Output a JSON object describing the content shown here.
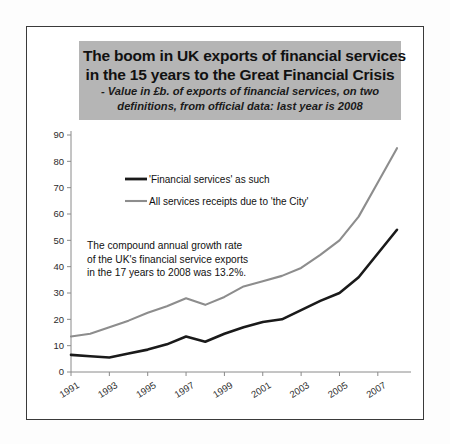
{
  "figure": {
    "title_lines": [
      "The boom in UK exports of financial services",
      "in the 15 years to the Great Financial Crisis"
    ],
    "subtitle_lines": [
      "- Value in £b. of exports of financial services, on two",
      "definitions, from official data: last year is 2008"
    ],
    "title_band_color": "#b5b5b5",
    "frame_color": "#3a3a3a"
  },
  "annotation": {
    "lines": [
      "The compound annual growth rate",
      "of the UK's financial service exports",
      "in the 17 years to 2008 was 13.2%."
    ]
  },
  "chart_data": {
    "type": "line",
    "title": "The boom in UK exports of financial services in the 15 years to the Great Financial Crisis",
    "subtitle": "- Value in £b. of exports of financial services, on two definitions, from official data: last year is 2008",
    "xlabel": "",
    "ylabel": "",
    "x": [
      1991,
      1992,
      1993,
      1994,
      1995,
      1996,
      1997,
      1998,
      1999,
      2000,
      2001,
      2002,
      2003,
      2004,
      2005,
      2006,
      2007,
      2008
    ],
    "x_tick_labels": [
      "1991",
      "1993",
      "1995",
      "1997",
      "1999",
      "2001",
      "2003",
      "2005",
      "2007"
    ],
    "x_tick_values": [
      1991,
      1993,
      1995,
      1997,
      1999,
      2001,
      2003,
      2005,
      2007
    ],
    "y_ticks": [
      0,
      10,
      20,
      30,
      40,
      50,
      60,
      70,
      80,
      90
    ],
    "ylim": [
      0,
      90
    ],
    "xlim": [
      1991,
      2008
    ],
    "grid": false,
    "legend_position": "upper-left",
    "series": [
      {
        "name": "'Financial services' as such",
        "color": "#1a1a1a",
        "values": [
          6.5,
          6.0,
          5.5,
          7.0,
          8.5,
          10.5,
          13.5,
          11.5,
          14.5,
          17.0,
          19.0,
          20.0,
          23.5,
          27.0,
          30.0,
          36.0,
          45.0,
          54.0
        ]
      },
      {
        "name": "All services receipts due to 'the City'",
        "color": "#8d8d8d",
        "values": [
          13.5,
          14.5,
          17.0,
          19.5,
          22.5,
          25.0,
          28.0,
          25.5,
          28.5,
          32.5,
          34.5,
          36.5,
          39.5,
          44.5,
          50.0,
          59.0,
          72.0,
          85.0
        ]
      }
    ]
  }
}
